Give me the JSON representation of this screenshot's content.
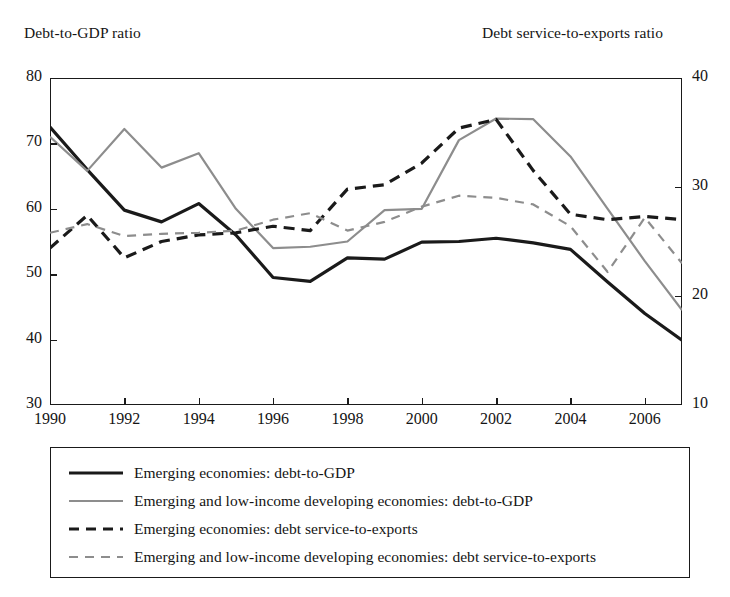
{
  "captions": {
    "left_axis": "Debt-to-GDP ratio",
    "right_axis": "Debt service-to-exports ratio"
  },
  "colors": {
    "series_dark": "#1a1a1a",
    "series_gray": "#8d8d8d",
    "frame": "#1a1a1a",
    "background": "#ffffff"
  },
  "legend": {
    "items": [
      {
        "label": "Emerging economies: debt-to-GDP",
        "style": "solid",
        "color": "#1a1a1a",
        "width": 3.2
      },
      {
        "label": "Emerging and low-income developing economies: debt-to-GDP",
        "style": "solid",
        "color": "#8d8d8d",
        "width": 2.2
      },
      {
        "label": "Emerging economies: debt service-to-exports",
        "style": "dashed",
        "color": "#1a1a1a",
        "width": 3.2
      },
      {
        "label": "Emerging and low-income developing economies: debt service-to-exports",
        "style": "dashed",
        "color": "#8d8d8d",
        "width": 2.2
      }
    ]
  },
  "chart_data": {
    "type": "line",
    "title": "",
    "xlabel": "",
    "ylabel": "Debt-to-GDP ratio",
    "y2label": "Debt service-to-exports ratio",
    "grid": false,
    "legend_position": "below",
    "x": [
      1990,
      1991,
      1992,
      1993,
      1994,
      1995,
      1996,
      1997,
      1998,
      1999,
      2000,
      2001,
      2002,
      2003,
      2004,
      2005,
      2006,
      2007
    ],
    "xlim": [
      1990,
      2007
    ],
    "xticks": [
      1990,
      1992,
      1994,
      1996,
      1998,
      2000,
      2002,
      2004,
      2006
    ],
    "xticklabels": [
      "1990",
      "1992",
      "1994",
      "1996",
      "1998",
      "2000",
      "2002",
      "2004",
      "2006"
    ],
    "ylim": [
      30,
      80
    ],
    "yticks": [
      30,
      40,
      50,
      60,
      70,
      80
    ],
    "yticklabels": [
      "30",
      "40",
      "50",
      "60",
      "70",
      "80"
    ],
    "y2lim": [
      10,
      40
    ],
    "y2ticks": [
      10,
      20,
      30,
      40
    ],
    "y2ticklabels": [
      "10",
      "20",
      "30",
      "40"
    ],
    "series": [
      {
        "name": "Emerging economies: debt-to-GDP",
        "axis": "left",
        "style": "solid",
        "color": "#1a1a1a",
        "width": 3.2,
        "values": [
          72.5,
          66.0,
          59.8,
          58.0,
          60.8,
          56.0,
          49.5,
          48.9,
          52.5,
          52.3,
          54.9,
          55.0,
          55.5,
          54.8,
          53.8,
          48.8,
          44.0,
          39.9
        ]
      },
      {
        "name": "Emerging and low-income developing economies: debt-to-GDP",
        "axis": "left",
        "style": "solid",
        "color": "#8d8d8d",
        "width": 2.2,
        "values": [
          71.0,
          65.8,
          72.2,
          66.3,
          68.5,
          60.0,
          54.0,
          54.2,
          55.0,
          59.8,
          60.0,
          70.5,
          73.8,
          73.7,
          68.0,
          60.0,
          52.0,
          44.5
        ]
      },
      {
        "name": "Emerging economies: debt service-to-exports",
        "axis": "right",
        "style": "dashed",
        "color": "#1a1a1a",
        "width": 3.2,
        "values": [
          24.4,
          27.4,
          23.5,
          25.0,
          25.6,
          25.8,
          26.4,
          26.0,
          29.8,
          30.2,
          32.2,
          35.4,
          36.2,
          31.5,
          27.5,
          27.0,
          27.3,
          27.0
        ]
      },
      {
        "name": "Emerging and low-income developing economies: debt service-to-exports",
        "axis": "right",
        "style": "dashed",
        "color": "#8d8d8d",
        "width": 2.2,
        "values": [
          25.8,
          26.6,
          25.5,
          25.7,
          25.8,
          26.0,
          27.0,
          27.6,
          26.0,
          26.8,
          28.2,
          29.2,
          29.0,
          28.4,
          26.4,
          22.2,
          27.2,
          23.0
        ]
      }
    ]
  }
}
